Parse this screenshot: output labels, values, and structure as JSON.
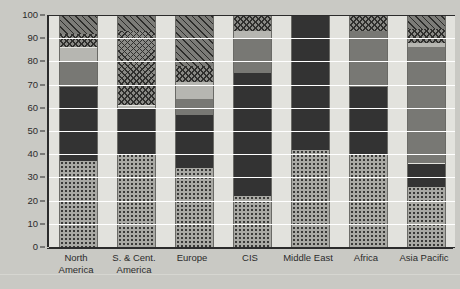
{
  "chart_data": {
    "type": "bar",
    "subtype": "stacked-percentage",
    "title": "",
    "xlabel": "",
    "ylabel": "",
    "ylim": [
      0,
      100
    ],
    "y_ticks": [
      0,
      10,
      20,
      30,
      40,
      50,
      60,
      70,
      80,
      90,
      100
    ],
    "grid": true,
    "legend": "none",
    "categories": [
      "North America",
      "S. & Cent. America",
      "Europe",
      "CIS",
      "Middle East",
      "Africa",
      "Asia Pacific"
    ],
    "series": [
      {
        "name": "Oil",
        "pattern": "dotted",
        "color": "#a9a9a4",
        "values": [
          37,
          40,
          34,
          22,
          42,
          40,
          26
        ]
      },
      {
        "name": "Gas",
        "pattern": "solid-dark",
        "color": "#333333",
        "values": [
          32,
          20,
          23,
          53,
          58,
          29,
          10
        ]
      },
      {
        "name": "Coal",
        "pattern": "solid-mid",
        "color": "#787874",
        "values": [
          11,
          0,
          7,
          15,
          0,
          24,
          50
        ]
      },
      {
        "name": "Nuclear",
        "pattern": "solid-light",
        "color": "#b6b6b1",
        "values": [
          6,
          1,
          7,
          3,
          0,
          0,
          2
        ]
      },
      {
        "name": "Hydroelectric",
        "pattern": "cross-hatch",
        "color": "#8a8a86",
        "values": [
          6,
          32,
          7,
          7,
          0,
          7,
          6
        ]
      },
      {
        "name": "Renewables",
        "pattern": "diagonal-hatch",
        "color": "#7c7c78",
        "values": [
          8,
          7,
          22,
          0,
          0,
          0,
          6
        ]
      }
    ],
    "stack_tops": {
      "North America": [
        37,
        69,
        80,
        86,
        92,
        100
      ],
      "S. & Cent. America": [
        40,
        60,
        60,
        61,
        93,
        100
      ],
      "Europe": [
        34,
        57,
        64,
        71,
        78,
        100
      ],
      "CIS": [
        22,
        75,
        90,
        93,
        100,
        100
      ],
      "Middle East": [
        42,
        100,
        100,
        100,
        100,
        100
      ],
      "Africa": [
        40,
        69,
        93,
        93,
        100,
        100
      ],
      "Asia Pacific": [
        26,
        36,
        86,
        88,
        94,
        100
      ]
    }
  },
  "axis": {
    "y_tick_labels": [
      "100",
      "90",
      "80",
      "70",
      "60",
      "50",
      "40",
      "30",
      "20",
      "10",
      "0"
    ],
    "x_tick_labels": [
      "North\nAmerica",
      "S. & Cent.\nAmerica",
      "Europe",
      "CIS",
      "Middle East",
      "Africa",
      "Asia Pacific"
    ]
  },
  "colors": {
    "background": "#c9c9c4",
    "plot_background": "#e2e2dd",
    "axis": "#2b2b2b",
    "gridline": "#ffffff"
  }
}
